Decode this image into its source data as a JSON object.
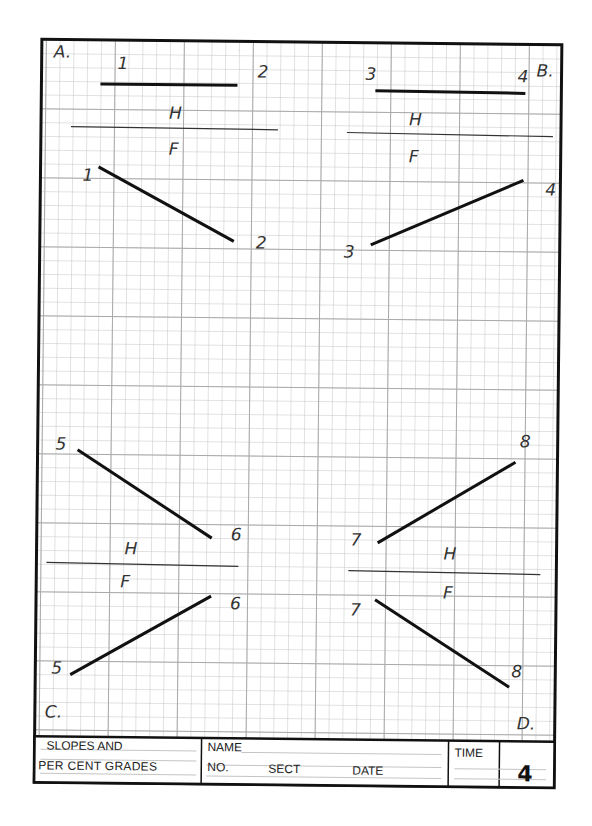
{
  "worksheet": {
    "quadrants": {
      "A": {
        "label": "A.",
        "top_left": "1",
        "top_right": "2",
        "h": "H",
        "f": "F",
        "front_left": "1",
        "front_right": "2"
      },
      "B": {
        "label": "B.",
        "top_left": "3",
        "top_right": "4",
        "h": "H",
        "f": "F",
        "front_left": "3",
        "front_right": "4"
      },
      "C": {
        "label": "C.",
        "top_left": "5",
        "top_right": "6",
        "h": "H",
        "f": "F",
        "front_left": "5",
        "front_right": "6"
      },
      "D": {
        "label": "D.",
        "top_left": "7",
        "top_right": "8",
        "h": "H",
        "f": "F",
        "front_left": "7",
        "front_right": "8"
      }
    },
    "title_block": {
      "title_line1": "SLOPES AND",
      "title_line2": "PER CENT GRADES",
      "name_label": "NAME",
      "no_label": "NO.",
      "sect_label": "SECT",
      "date_label": "DATE",
      "time_label": "TIME",
      "sheet_number": "4"
    },
    "colors": {
      "ink": "#111111",
      "grid": "#bdbdbd",
      "grid_major": "#a8a8a8"
    }
  }
}
